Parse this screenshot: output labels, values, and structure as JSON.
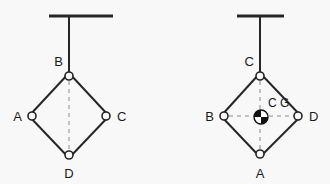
{
  "figure": {
    "background_color": "#f8f8f8",
    "stroke_color": "#262626",
    "dashed_color": "#8c8c8c",
    "node_fill": "#ffffff",
    "panels": [
      {
        "id": "left-panel",
        "name": "suspended-diamond-linkage-left",
        "ceiling": {
          "x1": 49,
          "x2": 113,
          "y": 16
        },
        "rod": {
          "x": 69,
          "y1": 16,
          "y2": 73
        },
        "diamond": {
          "top": {
            "x": 69,
            "y": 73,
            "label": "B",
            "label_x": 63,
            "label_y": 66,
            "anchor": "end"
          },
          "left": {
            "x": 29,
            "y": 116,
            "label": "A",
            "label_x": 22,
            "label_y": 121,
            "anchor": "end"
          },
          "right": {
            "x": 109,
            "y": 116,
            "label": "C",
            "label_x": 117,
            "label_y": 121,
            "anchor": "start"
          },
          "bottom": {
            "x": 69,
            "y": 158,
            "label": "D",
            "label_x": 69,
            "label_y": 178,
            "anchor": "middle"
          }
        },
        "dashed_lines": [
          {
            "x1": 69,
            "y1": 73,
            "x2": 69,
            "y2": 158
          }
        ],
        "cg": null
      },
      {
        "id": "right-panel",
        "name": "suspended-diamond-linkage-right",
        "ceiling": {
          "x1": 237,
          "x2": 284,
          "y": 16
        },
        "rod": {
          "x": 260,
          "y1": 16,
          "y2": 73
        },
        "diamond": {
          "top": {
            "x": 260,
            "y": 73,
            "label": "C",
            "label_x": 254,
            "label_y": 66,
            "anchor": "end"
          },
          "left": {
            "x": 221,
            "y": 116,
            "label": "B",
            "label_x": 214,
            "label_y": 121,
            "anchor": "end"
          },
          "right": {
            "x": 301,
            "y": 116,
            "label": "D",
            "label_x": 309,
            "label_y": 121,
            "anchor": "start"
          },
          "bottom": {
            "x": 260,
            "y": 157,
            "label": "A",
            "label_x": 260,
            "label_y": 178,
            "anchor": "middle"
          }
        },
        "dashed_lines": [
          {
            "x1": 260,
            "y1": 73,
            "x2": 260,
            "y2": 157
          },
          {
            "x1": 221,
            "y1": 116,
            "x2": 301,
            "y2": 116
          }
        ],
        "cg": {
          "x": 261,
          "y": 117,
          "radius": 7,
          "label": "C G",
          "label_x": 268,
          "label_y": 106
        }
      }
    ]
  },
  "labels": {
    "left_top": "B",
    "left_left": "A",
    "left_right": "C",
    "left_bottom": "D",
    "right_top": "C",
    "right_left": "B",
    "right_right": "D",
    "right_bottom": "A",
    "cg": "C G"
  }
}
